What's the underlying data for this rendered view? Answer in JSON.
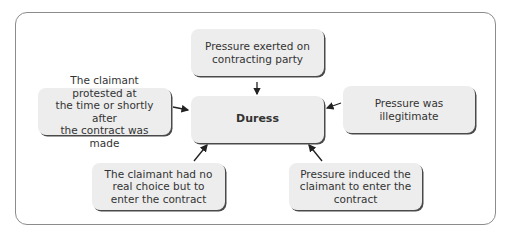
{
  "diagram": {
    "center": {
      "label": "Duress"
    },
    "nodes": [
      {
        "id": "top",
        "label": "Pressure exerted on\ncontracting party"
      },
      {
        "id": "left",
        "label": "The claimant protested at\nthe time or shortly after\nthe contract was made"
      },
      {
        "id": "right",
        "label": "Pressure was\nillegitimate"
      },
      {
        "id": "bottom-left",
        "label": "The claimant had no\nreal choice but to\nenter the contract"
      },
      {
        "id": "bottom-right",
        "label": "Pressure induced the\nclaimant to enter the\ncontract"
      }
    ],
    "edges": [
      {
        "from": "top",
        "to": "center"
      },
      {
        "from": "left",
        "to": "center"
      },
      {
        "from": "right",
        "to": "center"
      },
      {
        "from": "bottom-left",
        "to": "center"
      },
      {
        "from": "bottom-right",
        "to": "center"
      }
    ],
    "colors": {
      "box_fill": "#ededed",
      "box_shadow": "#4a4a4a",
      "frame": "#8c8c8c",
      "text": "#333333"
    }
  }
}
